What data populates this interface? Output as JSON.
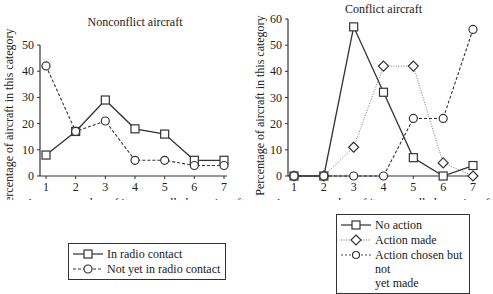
{
  "chart_data": [
    {
      "type": "line",
      "title": "Nonconflict aircraft",
      "xlabel": "Average number of items recalled per aircraft",
      "ylabel": "Percentage of aircraft in this category",
      "x": [
        1,
        2,
        3,
        4,
        5,
        6,
        7
      ],
      "ylim": [
        0,
        50
      ],
      "yticks": [
        0,
        10,
        20,
        30,
        40,
        50
      ],
      "grid": false,
      "legend_position": "below",
      "series": [
        {
          "name": "In radio contact",
          "marker": "square",
          "line": "solid",
          "values": [
            8,
            17,
            29,
            18,
            16,
            6,
            6
          ]
        },
        {
          "name": "Not yet in radio contact",
          "marker": "circle",
          "line": "dashed",
          "values": [
            42,
            17,
            21,
            6,
            6,
            4,
            4
          ]
        }
      ]
    },
    {
      "type": "line",
      "title": "Conflict aircraft",
      "xlabel": "Average number of items recalled per aircraft",
      "ylabel": "Percentage of aircraft in this category",
      "x": [
        1,
        2,
        3,
        4,
        5,
        6,
        7
      ],
      "ylim": [
        0,
        60
      ],
      "yticks": [
        0,
        10,
        20,
        30,
        40,
        50,
        60
      ],
      "grid": false,
      "legend_position": "below",
      "series": [
        {
          "name": "No action",
          "marker": "square",
          "line": "solid",
          "values": [
            0,
            0,
            57,
            32,
            7,
            0,
            4
          ]
        },
        {
          "name": "Action made",
          "marker": "diamond",
          "line": "dotted",
          "values": [
            0,
            0,
            11,
            42,
            42,
            5,
            0
          ]
        },
        {
          "name": "Action chosen but not yet made",
          "marker": "circle",
          "line": "dashed",
          "values": [
            0,
            0,
            0,
            0,
            22,
            22,
            56
          ]
        }
      ]
    }
  ],
  "legends": {
    "left": [
      "In radio contact",
      "Not yet in radio contact"
    ],
    "right": [
      "No action",
      "Action made",
      "Action chosen but not",
      "yet made"
    ]
  }
}
